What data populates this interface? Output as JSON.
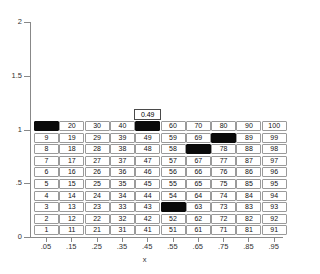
{
  "chart_data": {
    "type": "heatmap",
    "title": "",
    "xlabel": "x",
    "ylabel": "",
    "xlim": [
      0,
      1
    ],
    "ylim": [
      0,
      2
    ],
    "grid": false,
    "legend": null,
    "x_tick_labels": [
      ".05",
      ".15",
      ".25",
      ".35",
      ".45",
      ".55",
      ".65",
      ".75",
      ".85",
      ".95"
    ],
    "x_tick_values": [
      0.05,
      0.15,
      0.25,
      0.35,
      0.45,
      0.55,
      0.65,
      0.75,
      0.85,
      0.95
    ],
    "y_tick_labels": [
      "0",
      ".5",
      "1",
      "1.5",
      "2"
    ],
    "y_tick_values": [
      0,
      0.5,
      1,
      1.5,
      2
    ],
    "columns": 10,
    "rows": 10,
    "cell_row_y_values": [
      0.05,
      0.15,
      0.25,
      0.35,
      0.45,
      0.55,
      0.65,
      0.75,
      0.85,
      0.95
    ],
    "filled_cells": [
      10,
      50,
      79,
      68,
      53
    ],
    "cells": [
      {
        "label": "10",
        "col": 1,
        "row": 10,
        "filled": true
      },
      {
        "label": "20",
        "col": 2,
        "row": 10,
        "filled": false
      },
      {
        "label": "30",
        "col": 3,
        "row": 10,
        "filled": false
      },
      {
        "label": "40",
        "col": 4,
        "row": 10,
        "filled": false
      },
      {
        "label": "50",
        "col": 5,
        "row": 10,
        "filled": true
      },
      {
        "label": "60",
        "col": 6,
        "row": 10,
        "filled": false
      },
      {
        "label": "70",
        "col": 7,
        "row": 10,
        "filled": false
      },
      {
        "label": "80",
        "col": 8,
        "row": 10,
        "filled": false
      },
      {
        "label": "90",
        "col": 9,
        "row": 10,
        "filled": false
      },
      {
        "label": "100",
        "col": 10,
        "row": 10,
        "filled": false
      },
      {
        "label": "9",
        "col": 1,
        "row": 9,
        "filled": false
      },
      {
        "label": "19",
        "col": 2,
        "row": 9,
        "filled": false
      },
      {
        "label": "29",
        "col": 3,
        "row": 9,
        "filled": false
      },
      {
        "label": "39",
        "col": 4,
        "row": 9,
        "filled": false
      },
      {
        "label": "49",
        "col": 5,
        "row": 9,
        "filled": false
      },
      {
        "label": "59",
        "col": 6,
        "row": 9,
        "filled": false
      },
      {
        "label": "69",
        "col": 7,
        "row": 9,
        "filled": false
      },
      {
        "label": "79",
        "col": 8,
        "row": 9,
        "filled": true
      },
      {
        "label": "89",
        "col": 9,
        "row": 9,
        "filled": false
      },
      {
        "label": "99",
        "col": 10,
        "row": 9,
        "filled": false
      },
      {
        "label": "8",
        "col": 1,
        "row": 8,
        "filled": false
      },
      {
        "label": "18",
        "col": 2,
        "row": 8,
        "filled": false
      },
      {
        "label": "28",
        "col": 3,
        "row": 8,
        "filled": false
      },
      {
        "label": "38",
        "col": 4,
        "row": 8,
        "filled": false
      },
      {
        "label": "48",
        "col": 5,
        "row": 8,
        "filled": false
      },
      {
        "label": "58",
        "col": 6,
        "row": 8,
        "filled": false
      },
      {
        "label": "68",
        "col": 7,
        "row": 8,
        "filled": true
      },
      {
        "label": "78",
        "col": 8,
        "row": 8,
        "filled": false
      },
      {
        "label": "88",
        "col": 9,
        "row": 8,
        "filled": false
      },
      {
        "label": "98",
        "col": 10,
        "row": 8,
        "filled": false
      },
      {
        "label": "7",
        "col": 1,
        "row": 7,
        "filled": false
      },
      {
        "label": "17",
        "col": 2,
        "row": 7,
        "filled": false
      },
      {
        "label": "27",
        "col": 3,
        "row": 7,
        "filled": false
      },
      {
        "label": "37",
        "col": 4,
        "row": 7,
        "filled": false
      },
      {
        "label": "47",
        "col": 5,
        "row": 7,
        "filled": false
      },
      {
        "label": "57",
        "col": 6,
        "row": 7,
        "filled": false
      },
      {
        "label": "67",
        "col": 7,
        "row": 7,
        "filled": false
      },
      {
        "label": "77",
        "col": 8,
        "row": 7,
        "filled": false
      },
      {
        "label": "87",
        "col": 9,
        "row": 7,
        "filled": false
      },
      {
        "label": "97",
        "col": 10,
        "row": 7,
        "filled": false
      },
      {
        "label": "6",
        "col": 1,
        "row": 6,
        "filled": false
      },
      {
        "label": "16",
        "col": 2,
        "row": 6,
        "filled": false
      },
      {
        "label": "26",
        "col": 3,
        "row": 6,
        "filled": false
      },
      {
        "label": "36",
        "col": 4,
        "row": 6,
        "filled": false
      },
      {
        "label": "46",
        "col": 5,
        "row": 6,
        "filled": false
      },
      {
        "label": "56",
        "col": 6,
        "row": 6,
        "filled": false
      },
      {
        "label": "66",
        "col": 7,
        "row": 6,
        "filled": false
      },
      {
        "label": "76",
        "col": 8,
        "row": 6,
        "filled": false
      },
      {
        "label": "86",
        "col": 9,
        "row": 6,
        "filled": false
      },
      {
        "label": "96",
        "col": 10,
        "row": 6,
        "filled": false
      },
      {
        "label": "5",
        "col": 1,
        "row": 5,
        "filled": false
      },
      {
        "label": "15",
        "col": 2,
        "row": 5,
        "filled": false
      },
      {
        "label": "25",
        "col": 3,
        "row": 5,
        "filled": false
      },
      {
        "label": "35",
        "col": 4,
        "row": 5,
        "filled": false
      },
      {
        "label": "45",
        "col": 5,
        "row": 5,
        "filled": false
      },
      {
        "label": "55",
        "col": 6,
        "row": 5,
        "filled": false
      },
      {
        "label": "65",
        "col": 7,
        "row": 5,
        "filled": false
      },
      {
        "label": "75",
        "col": 8,
        "row": 5,
        "filled": false
      },
      {
        "label": "85",
        "col": 9,
        "row": 5,
        "filled": false
      },
      {
        "label": "95",
        "col": 10,
        "row": 5,
        "filled": false
      },
      {
        "label": "4",
        "col": 1,
        "row": 4,
        "filled": false
      },
      {
        "label": "14",
        "col": 2,
        "row": 4,
        "filled": false
      },
      {
        "label": "24",
        "col": 3,
        "row": 4,
        "filled": false
      },
      {
        "label": "34",
        "col": 4,
        "row": 4,
        "filled": false
      },
      {
        "label": "44",
        "col": 5,
        "row": 4,
        "filled": false
      },
      {
        "label": "54",
        "col": 6,
        "row": 4,
        "filled": false
      },
      {
        "label": "64",
        "col": 7,
        "row": 4,
        "filled": false
      },
      {
        "label": "74",
        "col": 8,
        "row": 4,
        "filled": false
      },
      {
        "label": "84",
        "col": 9,
        "row": 4,
        "filled": false
      },
      {
        "label": "94",
        "col": 10,
        "row": 4,
        "filled": false
      },
      {
        "label": "3",
        "col": 1,
        "row": 3,
        "filled": false
      },
      {
        "label": "13",
        "col": 2,
        "row": 3,
        "filled": false
      },
      {
        "label": "23",
        "col": 3,
        "row": 3,
        "filled": false
      },
      {
        "label": "33",
        "col": 4,
        "row": 3,
        "filled": false
      },
      {
        "label": "43",
        "col": 5,
        "row": 3,
        "filled": false
      },
      {
        "label": "53",
        "col": 6,
        "row": 3,
        "filled": true
      },
      {
        "label": "63",
        "col": 7,
        "row": 3,
        "filled": false
      },
      {
        "label": "73",
        "col": 8,
        "row": 3,
        "filled": false
      },
      {
        "label": "83",
        "col": 9,
        "row": 3,
        "filled": false
      },
      {
        "label": "93",
        "col": 10,
        "row": 3,
        "filled": false
      },
      {
        "label": "2",
        "col": 1,
        "row": 2,
        "filled": false
      },
      {
        "label": "12",
        "col": 2,
        "row": 2,
        "filled": false
      },
      {
        "label": "22",
        "col": 3,
        "row": 2,
        "filled": false
      },
      {
        "label": "32",
        "col": 4,
        "row": 2,
        "filled": false
      },
      {
        "label": "42",
        "col": 5,
        "row": 2,
        "filled": false
      },
      {
        "label": "52",
        "col": 6,
        "row": 2,
        "filled": false
      },
      {
        "label": "62",
        "col": 7,
        "row": 2,
        "filled": false
      },
      {
        "label": "72",
        "col": 8,
        "row": 2,
        "filled": false
      },
      {
        "label": "82",
        "col": 9,
        "row": 2,
        "filled": false
      },
      {
        "label": "92",
        "col": 10,
        "row": 2,
        "filled": false
      },
      {
        "label": "1",
        "col": 1,
        "row": 1,
        "filled": false
      },
      {
        "label": "11",
        "col": 2,
        "row": 1,
        "filled": false
      },
      {
        "label": "21",
        "col": 3,
        "row": 1,
        "filled": false
      },
      {
        "label": "31",
        "col": 4,
        "row": 1,
        "filled": false
      },
      {
        "label": "41",
        "col": 5,
        "row": 1,
        "filled": false
      },
      {
        "label": "51",
        "col": 6,
        "row": 1,
        "filled": false
      },
      {
        "label": "61",
        "col": 7,
        "row": 1,
        "filled": false
      },
      {
        "label": "71",
        "col": 8,
        "row": 1,
        "filled": false
      },
      {
        "label": "81",
        "col": 9,
        "row": 1,
        "filled": false
      },
      {
        "label": "91",
        "col": 10,
        "row": 1,
        "filled": false
      }
    ],
    "annotations": [
      {
        "name": "value-tooltip",
        "text": "0.49",
        "col": 5,
        "row": 10,
        "placement": "above"
      }
    ]
  },
  "colors": {
    "background": "#ffffff",
    "cell_border": "#9a9a9a",
    "cell_fill": "#ffffff",
    "cell_filled": "#0a0a0a",
    "axis": "#888888",
    "text": "#111111"
  }
}
